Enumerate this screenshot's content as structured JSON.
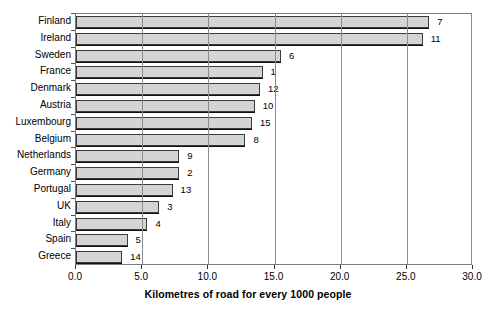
{
  "chart_data": {
    "type": "bar",
    "orientation": "horizontal",
    "title": "",
    "xlabel": "Kilometres of road for every 1000 people",
    "ylabel": "",
    "xlim": [
      0.0,
      30.0
    ],
    "xticks": [
      "0.0",
      "5.0",
      "10.0",
      "15.0",
      "20.0",
      "25.0",
      "30.0"
    ],
    "xtick_values": [
      0,
      5,
      10,
      15,
      20,
      25,
      30
    ],
    "grid": true,
    "grid_axis": "x",
    "legend": "none",
    "categories": [
      "Finland",
      "Ireland",
      "Sweden",
      "France",
      "Denmark",
      "Austria",
      "Luxembourg",
      "Belgium",
      "Netherlands",
      "Germany",
      "Portugal",
      "UK",
      "Italy",
      "Spain",
      "Greece"
    ],
    "values": [
      26.7,
      26.2,
      15.5,
      14.1,
      13.9,
      13.5,
      13.3,
      12.8,
      7.8,
      7.8,
      7.3,
      6.3,
      5.4,
      3.9,
      3.5
    ],
    "point_labels": [
      "7",
      "11",
      "6",
      "1",
      "12",
      "10",
      "15",
      "8",
      "9",
      "2",
      "13",
      "3",
      "4",
      "5",
      "14"
    ],
    "bars": [
      {
        "category": "Finland",
        "value": 26.7,
        "label": "7"
      },
      {
        "category": "Ireland",
        "value": 26.2,
        "label": "11"
      },
      {
        "category": "Sweden",
        "value": 15.5,
        "label": "6"
      },
      {
        "category": "France",
        "value": 14.1,
        "label": "1"
      },
      {
        "category": "Denmark",
        "value": 13.9,
        "label": "12"
      },
      {
        "category": "Austria",
        "value": 13.5,
        "label": "10"
      },
      {
        "category": "Luxembourg",
        "value": 13.3,
        "label": "15"
      },
      {
        "category": "Belgium",
        "value": 12.8,
        "label": "8"
      },
      {
        "category": "Netherlands",
        "value": 7.8,
        "label": "9"
      },
      {
        "category": "Germany",
        "value": 7.8,
        "label": "2"
      },
      {
        "category": "Portugal",
        "value": 7.3,
        "label": "13"
      },
      {
        "category": "UK",
        "value": 6.3,
        "label": "3"
      },
      {
        "category": "Italy",
        "value": 5.4,
        "label": "4"
      },
      {
        "category": "Spain",
        "value": 3.9,
        "label": "5"
      },
      {
        "category": "Greece",
        "value": 3.5,
        "label": "14"
      }
    ],
    "colors": {
      "bar_fill": "#d4d4d4",
      "bar_edge": "#3a3a3a",
      "grid": "#8c8c8c",
      "axis": "#555555",
      "text": "#000000",
      "background": "#ffffff"
    }
  }
}
